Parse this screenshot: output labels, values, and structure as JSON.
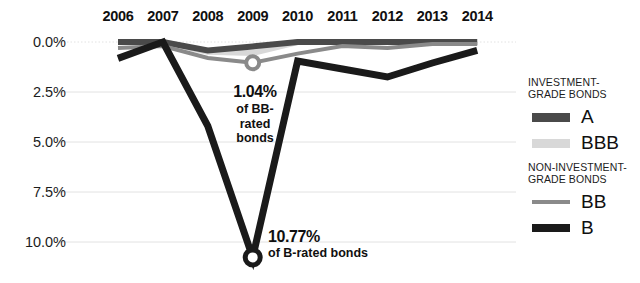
{
  "chart_data": {
    "type": "line",
    "title": "",
    "subtitle": "",
    "xlabel": "",
    "ylabel": "",
    "categories": [
      "2006",
      "2007",
      "2008",
      "2009",
      "2010",
      "2011",
      "2012",
      "2013",
      "2014"
    ],
    "ylim": [
      0.0,
      10.77
    ],
    "y_axis_inverted": true,
    "y_ticks": [
      "0.0%",
      "2.5%",
      "5.0%",
      "7.5%",
      "10.0%"
    ],
    "y_tick_values": [
      0.0,
      2.5,
      5.0,
      7.5,
      10.0
    ],
    "grid": true,
    "legend_position": "right",
    "series": [
      {
        "name": "A",
        "group": "Investment-grade bonds",
        "color": "#4a4a4a",
        "width": 6,
        "values": [
          0.0,
          0.0,
          0.42,
          0.22,
          0.0,
          0.0,
          0.0,
          0.0,
          0.0
        ]
      },
      {
        "name": "BBB",
        "group": "Investment-grade bonds",
        "color": "#d8d8d8",
        "width": 6,
        "values": [
          0.0,
          0.0,
          0.49,
          0.55,
          0.0,
          0.0,
          0.0,
          0.0,
          0.0
        ]
      },
      {
        "name": "BB",
        "group": "Non-investment-grade bonds",
        "color": "#8a8a8a",
        "width": 4,
        "values": [
          0.3,
          0.2,
          0.8,
          1.04,
          0.58,
          0.2,
          0.3,
          0.1,
          0.1
        ],
        "marker_index": 3,
        "marker_value": 1.04
      },
      {
        "name": "B",
        "group": "Non-investment-grade bonds",
        "color": "#1a1a1a",
        "width": 7,
        "values": [
          0.82,
          0.0,
          4.2,
          10.77,
          0.95,
          1.35,
          1.75,
          1.05,
          0.42
        ],
        "marker_index": 3,
        "marker_value": 10.77
      }
    ],
    "annotations": [
      {
        "name": "bb-callout",
        "value": "1.04%",
        "description": "of BB-rated bonds",
        "description_lines": [
          "of BB-",
          "rated",
          "bonds"
        ],
        "series": "BB",
        "at_category": "2009"
      },
      {
        "name": "b-callout",
        "value": "10.77%",
        "description": "of B-rated bonds",
        "description_lines": [
          "of B-rated bonds"
        ],
        "series": "B",
        "at_category": "2009"
      }
    ]
  },
  "legend": {
    "groups": [
      {
        "title": "INVESTMENT-\nGRADE BONDS",
        "items": [
          {
            "label": "A",
            "color": "#4a4a4a",
            "thickness": 9
          },
          {
            "label": "BBB",
            "color": "#d8d8d8",
            "thickness": 9
          }
        ]
      },
      {
        "title": "NON-INVESTMENT-\nGRADE BONDS",
        "items": [
          {
            "label": "BB",
            "color": "#8a8a8a",
            "thickness": 4
          },
          {
            "label": "B",
            "color": "#1a1a1a",
            "thickness": 8
          }
        ]
      }
    ]
  },
  "colors": {
    "background": "#ffffff",
    "text": "#101010",
    "grid": "#e2e2e2",
    "a": "#4a4a4a",
    "bbb": "#d8d8d8",
    "bb": "#8a8a8a",
    "b": "#1a1a1a"
  }
}
